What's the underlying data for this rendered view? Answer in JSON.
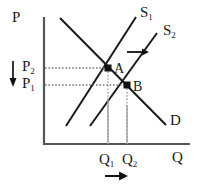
{
  "figure": {
    "type": "supply-demand-diagram",
    "width": 199,
    "height": 190,
    "background": "#ffffff",
    "line_color": "#1a1a1a",
    "axis_color": "#555555",
    "dotted_color": "#777777",
    "drop_line_color": "#9a9a9a"
  },
  "axes": {
    "y_label": "P",
    "x_label": "Q"
  },
  "curves": [
    {
      "id": "s1",
      "label": "S",
      "subscript": "1",
      "kind": "supply"
    },
    {
      "id": "s2",
      "label": "S",
      "subscript": "2",
      "kind": "supply"
    },
    {
      "id": "d",
      "label": "D",
      "subscript": "",
      "kind": "demand"
    }
  ],
  "points": [
    {
      "id": "a",
      "label": "A",
      "price": "P2",
      "quantity": "Q1"
    },
    {
      "id": "b",
      "label": "B",
      "price": "P1",
      "quantity": "Q2"
    }
  ],
  "price_axis_labels": [
    {
      "label": "P",
      "subscript": "2"
    },
    {
      "label": "P",
      "subscript": "1"
    }
  ],
  "quantity_axis_labels": [
    {
      "label": "Q",
      "subscript": "1"
    },
    {
      "label": "Q",
      "subscript": "2"
    }
  ],
  "arrows": {
    "price_arrow": "down-arrow-price-decrease",
    "supply_shift_arrow": "right-arrow-supply-shift",
    "quantity_arrow": "right-arrow-quantity-increase"
  }
}
